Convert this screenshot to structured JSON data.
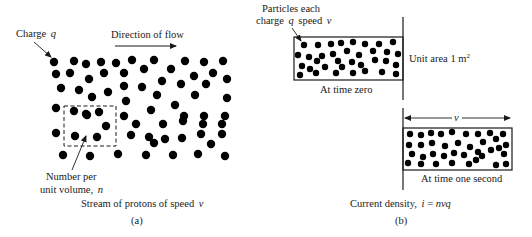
{
  "figure": {
    "panel_a": {
      "charge_label": "Charge",
      "charge_symbol": "q",
      "direction_label": "Direction of flow",
      "number_label_line1": "Number per",
      "number_label_line2": "unit volume,",
      "number_symbol": "n",
      "caption": "Stream of protons of speed",
      "caption_symbol": "v",
      "panel_id": "(a)"
    },
    "panel_b": {
      "particles_label_line1": "Particles each",
      "particles_label_line2_prefix": "charge",
      "particles_label_q": "q",
      "particles_label_speed": "speed",
      "particles_label_v": "v",
      "unit_area_label": "Unit area 1 m",
      "unit_area_sup": "2",
      "time_zero_label": "At time zero",
      "time_one_label": "At time one second",
      "distance_label": "v",
      "caption": "Current density,",
      "caption_eq_lhs": "i",
      "caption_eq_sign": " = ",
      "caption_eq_rhs": "nvq",
      "panel_id": "(b)"
    },
    "particle_symbol": "⊕"
  }
}
